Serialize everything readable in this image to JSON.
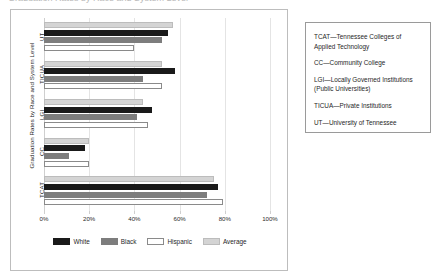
{
  "title_sliver": "Graduation Rates by Race and System Level",
  "chart_panel": {
    "y_axis_title": "Graduation Rates by Race and System Level"
  },
  "abbreviations": {
    "items": [
      "TCAT—Tennessee Colleges of Applied Technology",
      "CC—Community College",
      "LGI—Locally Governed Institutions (Public Universities)",
      "TICUA—Private Institutions",
      "UT—University of Tennessee"
    ]
  },
  "colors": {
    "white_series": "#1a1a1a",
    "black_series": "#7d7d7d",
    "hispanic_series": "#ffffff",
    "average_series": "#d4d4d4",
    "gridline": "#e4e4e4",
    "panel_border": "#bdbdbd",
    "box_border": "#9a9a9a"
  },
  "chart_data": {
    "type": "bar",
    "orientation": "horizontal",
    "title": "",
    "xlabel": "",
    "ylabel": "Graduation Rates by Race and System Level",
    "categories": [
      "TCAT",
      "CC",
      "LGI",
      "TICUA",
      "UT"
    ],
    "category_order_top_to_bottom": [
      "UT",
      "TICUA",
      "LGI",
      "CC",
      "TCAT"
    ],
    "series": [
      {
        "name": "White",
        "values": [
          77,
          18,
          48,
          58,
          55
        ]
      },
      {
        "name": "Black",
        "values": [
          72,
          11,
          41,
          44,
          52
        ]
      },
      {
        "name": "Hispanic",
        "values": [
          79,
          20,
          46,
          52,
          40
        ]
      },
      {
        "name": "Average",
        "values": [
          75,
          20,
          44,
          52,
          57
        ]
      }
    ],
    "xlim": [
      0,
      100
    ],
    "xticks": [
      0,
      20,
      40,
      60,
      80,
      100
    ],
    "xtick_labels": [
      "0%",
      "20%",
      "40%",
      "60%",
      "80%",
      "100%"
    ],
    "grid": true,
    "legend_position": "bottom",
    "legend_entries": [
      "White",
      "Black",
      "Hispanic",
      "Average"
    ],
    "value_suffix": "%"
  }
}
